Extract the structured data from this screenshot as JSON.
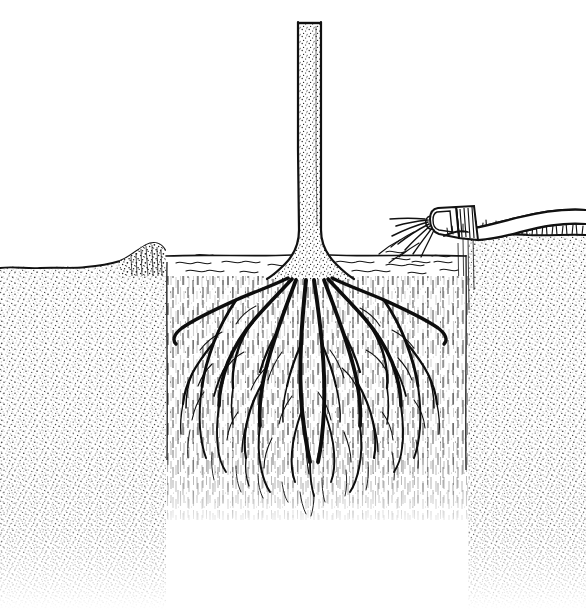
{
  "document": {
    "title": "Tree Root Zone Irrigation",
    "medium": "pen-and-ink stipple line drawing",
    "caption": "",
    "background_color": "#ffffff",
    "ink_color": "#111111",
    "canvas": {
      "width": 586,
      "height": 611
    }
  },
  "scene": {
    "description": "Cross-section of a young tree trunk with a fibrous root system inside a watering basin, irrigated by a hand-held hose nozzle at the right.",
    "subject": "tree-root-zone-cross-section"
  },
  "elements": {
    "trunk": {
      "name": "tree-trunk",
      "label": "Tree trunk",
      "texture": "stipple",
      "top_y": 22,
      "bottom_y": 276,
      "left_x": 297,
      "right_x": 322,
      "flare_width": 54
    },
    "roots": {
      "name": "root-system",
      "label": "Fibrous root system",
      "crown_x": 310,
      "crown_y": 278,
      "spread_left_x": 176,
      "spread_right_x": 450,
      "depth_y": 500,
      "main_root_count": 12,
      "branch_levels": 4
    },
    "water_basin": {
      "name": "water-basin",
      "label": "Watering basin",
      "surface_y": 258,
      "left_x": 166,
      "right_x": 468,
      "ripple_line_count": 7,
      "water_depth": 20
    },
    "wet_soil_zone": {
      "name": "moist-soil-zone",
      "label": "Moistened soil zone",
      "texture": "vertical dashed hatching",
      "left_x": 166,
      "right_x": 468,
      "top_y": 276,
      "bottom_y": 520
    },
    "dry_soil": {
      "name": "dry-soil",
      "label": "Surrounding dry soil",
      "texture": "stipple",
      "surface_left_y": 268,
      "surface_right_y": 234,
      "fade_bottom_y": 600
    },
    "berm_left": {
      "name": "soil-berm-left",
      "label": "Left basin berm",
      "peak_x": 145,
      "peak_y": 245,
      "base_y": 268
    },
    "berm_right": {
      "name": "soil-berm-right",
      "label": "Right basin berm",
      "peak_x": 470,
      "peak_y": 232,
      "base_y": 240
    },
    "hose": {
      "name": "garden-hose",
      "label": "Garden hose",
      "entry_x": 586,
      "entry_y": 218,
      "nozzle_x": 448,
      "nozzle_y": 213
    },
    "nozzle": {
      "name": "hose-nozzle",
      "label": "Hose nozzle",
      "x": 437,
      "y": 208,
      "width": 32,
      "height": 24
    },
    "spray": {
      "name": "water-spray",
      "label": "Water spray",
      "origin_x": 438,
      "origin_y": 224,
      "ray_count": 7,
      "reach_x": 386,
      "reach_y": 250
    },
    "grass": {
      "name": "grass-tufts",
      "label": "Grass tufts on soil surface",
      "start_x": 468,
      "end_x": 586,
      "baseline_y": 236
    }
  },
  "palette": {
    "ink": "#111111",
    "paper": "#ffffff",
    "soft_ink": "#2a2a2a",
    "light_ink": "#555555"
  }
}
